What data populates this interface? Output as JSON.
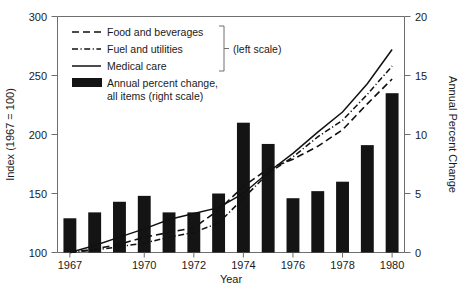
{
  "chart_data": {
    "type": "bar",
    "title": "",
    "xlabel": "Year",
    "ylabel": "Index (1967 = 100)",
    "y2label": "Annual Percent Change",
    "grid": false,
    "legend_position": "top-left",
    "x": [
      1967,
      1968,
      1969,
      1970,
      1971,
      1972,
      1973,
      1974,
      1975,
      1976,
      1977,
      1978,
      1979,
      1980
    ],
    "categories": [
      "1967",
      "1968",
      "1969",
      "1970",
      "1971",
      "1972",
      "1973",
      "1974",
      "1975",
      "1976",
      "1977",
      "1978",
      "1979",
      "1980"
    ],
    "xtick_values": [
      1967,
      1970,
      1972,
      1974,
      1976,
      1978,
      1980
    ],
    "xtick_labels": [
      "1967",
      "1970",
      "1972",
      "1974",
      "1976",
      "1978",
      "1980"
    ],
    "ylim": [
      100,
      300
    ],
    "ytick_values": [
      100,
      150,
      200,
      250,
      300
    ],
    "ytick_labels": [
      "100",
      "150",
      "200",
      "250",
      "300"
    ],
    "y2lim": [
      0,
      20
    ],
    "y2tick_values": [
      0,
      5,
      10,
      15,
      20
    ],
    "y2tick_labels": [
      "0",
      "5",
      "10",
      "15",
      "20"
    ],
    "bars": {
      "name": "Annual percent change, all items (right scale)",
      "axis": "right",
      "color": "#141414",
      "values": [
        2.9,
        3.4,
        4.3,
        4.8,
        3.4,
        3.4,
        5.0,
        11.0,
        9.2,
        4.6,
        5.2,
        6.0,
        9.1,
        13.5
      ]
    },
    "series": [
      {
        "name": "Food and beverages",
        "axis": "left",
        "style": "dashed",
        "values": [
          100,
          103,
          107,
          113,
          117,
          121,
          136,
          156,
          171,
          179,
          190,
          204,
          226,
          247
        ]
      },
      {
        "name": "Fuel and utilities",
        "axis": "left",
        "style": "dash-dot",
        "values": [
          100,
          102,
          105,
          108,
          113,
          117,
          125,
          146,
          167,
          181,
          198,
          212,
          234,
          258
        ]
      },
      {
        "name": "Medical care",
        "axis": "left",
        "style": "solid",
        "values": [
          100,
          106,
          113,
          120,
          128,
          133,
          138,
          150,
          168,
          184,
          202,
          219,
          243,
          272
        ]
      }
    ],
    "legend_entries": [
      {
        "label": "Food and beverages",
        "style": "dashed"
      },
      {
        "label": "Fuel and utilities",
        "style": "dash-dot"
      },
      {
        "label": "Medical care",
        "style": "solid"
      },
      {
        "label": "Annual percent change,",
        "label2": "all items (right scale)",
        "style": "bar-swatch"
      }
    ],
    "legend_bracket_note": "(left scale)"
  }
}
